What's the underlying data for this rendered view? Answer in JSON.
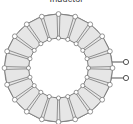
{
  "figure": {
    "caption": "Inductor",
    "component_type": "toroidal-inductor",
    "alt_label": "Toroidal inductor with wound core and two terminals"
  },
  "colors": {
    "winding_fill": "#e6e6e6",
    "winding_stroke": "#6b6b6b",
    "core_stroke": "#555555",
    "lead_stroke": "#4a4a4a",
    "terminal_fill": "#ffffff",
    "background": "#ffffff",
    "caption_color": "#3a3a3a"
  },
  "geometry": {
    "center_x": 58.5,
    "center_y": 68,
    "outer_radius": 54,
    "inner_radius": 30,
    "turn_count": 20,
    "bump_radius": 2.4,
    "stroke_width": 0.7
  },
  "leads": [
    {
      "name": "terminal-top",
      "x1": 104,
      "y1": 62,
      "x2": 126,
      "y2": 62,
      "dot_x": 126,
      "dot_y": 62,
      "dot_r": 2.6
    },
    {
      "name": "terminal-bottom",
      "x1": 104,
      "y1": 78,
      "x2": 126,
      "y2": 78,
      "dot_x": 126,
      "dot_y": 78,
      "dot_r": 2.6
    }
  ]
}
